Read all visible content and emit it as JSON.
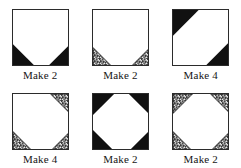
{
  "page": {
    "background_color": "#ffffff",
    "line_color": "#2b2b2b",
    "solid_fill_color": "#111111",
    "print_fill_color": "#8c8c8c"
  },
  "blocks": [
    {
      "id": "block-1",
      "label": "Make 2",
      "count": 2,
      "corner_fill": "solid",
      "corner_size_pct": 40,
      "corners": [
        "bottom-left",
        "bottom-right"
      ]
    },
    {
      "id": "block-2",
      "label": "Make 2",
      "count": 2,
      "corner_fill": "print",
      "corner_size_pct": 34,
      "corners": [
        "bottom-left",
        "bottom-right"
      ]
    },
    {
      "id": "block-3",
      "label": "Make 4",
      "count": 4,
      "corner_fill": "solid",
      "corner_size_pct": 45,
      "corners": [
        "top-left",
        "bottom-right"
      ]
    },
    {
      "id": "block-4",
      "label": "Make 4",
      "count": 4,
      "corner_fill": "print",
      "corner_size_pct": 34,
      "corners": [
        "top-right",
        "bottom-left",
        "bottom-right"
      ]
    },
    {
      "id": "block-5",
      "label": "Make 2",
      "count": 2,
      "corner_fill": "solid",
      "corner_size_pct": 37,
      "corners": [
        "top-left",
        "top-right",
        "bottom-left",
        "bottom-right"
      ]
    },
    {
      "id": "block-6",
      "label": "Make 2",
      "count": 2,
      "corner_fill": "print",
      "corner_size_pct": 34,
      "corners": [
        "top-left",
        "top-right",
        "bottom-left",
        "bottom-right"
      ]
    }
  ]
}
